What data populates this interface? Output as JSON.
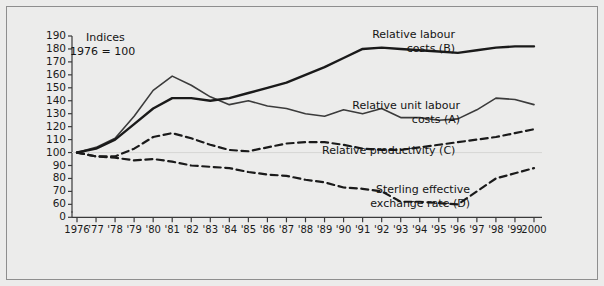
{
  "figure": {
    "caption_line1": "Indices",
    "caption_line2": "1976 = 100",
    "background_color": "#ececeb",
    "frame_color": "#8e8e8e",
    "ink_color": "#1a1a1a"
  },
  "chart_data": {
    "type": "line",
    "title": "",
    "subtitle": "Indices 1976 = 100",
    "xlabel": "",
    "ylabel": "",
    "grid": false,
    "legend_position": "inline-annotations",
    "ylim": [
      55,
      193
    ],
    "yticks": [
      190,
      180,
      170,
      160,
      150,
      140,
      130,
      120,
      110,
      100,
      90,
      80,
      70,
      60,
      0
    ],
    "ytick_labels": [
      "190",
      "180",
      "170",
      "160",
      "150",
      "140",
      "130",
      "120",
      "110",
      "100",
      "90",
      "80",
      "70",
      "60",
      "0"
    ],
    "x": [
      1976,
      1977,
      1978,
      1979,
      1980,
      1981,
      1982,
      1983,
      1984,
      1985,
      1986,
      1987,
      1988,
      1989,
      1990,
      1991,
      1992,
      1993,
      1994,
      1995,
      1996,
      1997,
      1998,
      1999,
      2000
    ],
    "xtick_labels": [
      "1976",
      "'77",
      "'78",
      "'79",
      "'80",
      "'81",
      "'82",
      "'83",
      "'84",
      "'85",
      "'86",
      "'87",
      "'88",
      "'89",
      "'90",
      "'91",
      "'92",
      "'93",
      "'94",
      "'95",
      "'96",
      "'97",
      "'98",
      "'99",
      "2000"
    ],
    "series": [
      {
        "name": "Relative unit labour costs (A)",
        "key": "A",
        "style": "solid",
        "width": 1.6,
        "color": "#3b3b3b",
        "label_line1": "Relative unit labour",
        "label_line2": "costs (A)",
        "values": [
          100,
          104,
          111,
          128,
          148,
          159,
          152,
          143,
          137,
          140,
          136,
          134,
          130,
          128,
          133,
          130,
          134,
          127,
          127,
          125,
          126,
          133,
          142,
          141,
          137
        ]
      },
      {
        "name": "Relative labour costs (B)",
        "key": "B",
        "style": "solid",
        "width": 2.4,
        "color": "#1a1a1a",
        "label_line1": "Relative labour",
        "label_line2": "costs (B)",
        "values": [
          100,
          103,
          110,
          122,
          134,
          142,
          142,
          140,
          142,
          146,
          150,
          154,
          160,
          166,
          173,
          180,
          181,
          180,
          179,
          178,
          177,
          179,
          181,
          182,
          182
        ]
      },
      {
        "name": "Relative productivity (C)",
        "key": "C",
        "style": "dashed",
        "width": 2.2,
        "color": "#1a1a1a",
        "label_line1": "Relative productivity (C)",
        "label_line2": "",
        "values": [
          100,
          97,
          97,
          103,
          112,
          115,
          111,
          106,
          102,
          101,
          104,
          107,
          108,
          108,
          106,
          103,
          102,
          102,
          104,
          106,
          108,
          110,
          112,
          115,
          118
        ]
      },
      {
        "name": "Sterling effective exchange rate (D)",
        "key": "D",
        "style": "dashed",
        "width": 2.2,
        "color": "#1a1a1a",
        "label_line1": "Sterling effective",
        "label_line2": "exchange rate (D)",
        "values": [
          100,
          97,
          96,
          94,
          95,
          93,
          90,
          89,
          88,
          85,
          83,
          82,
          79,
          77,
          73,
          72,
          70,
          62,
          62,
          61,
          60,
          70,
          80,
          84,
          88
        ]
      }
    ]
  }
}
